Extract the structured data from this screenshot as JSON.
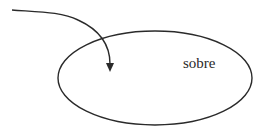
{
  "diagram": {
    "ellipse_label": "sobre",
    "stroke_color": "#2a2a2a",
    "background": "#ffffff"
  }
}
